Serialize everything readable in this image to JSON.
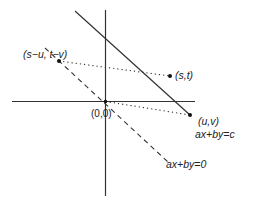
{
  "diagram": {
    "title": "",
    "labels": {
      "point_diff": "(s−u, t−v)",
      "point_st": "(s,t)",
      "point_uv": "(u,v)",
      "origin": "(0,0)",
      "line_c": "ax+by=c",
      "line_0": "ax+by=0"
    },
    "colors": {
      "stroke": "#333333",
      "background": "#ffffff"
    },
    "elements": [
      {
        "kind": "axis",
        "orientation": "horizontal"
      },
      {
        "kind": "axis",
        "orientation": "vertical"
      },
      {
        "kind": "line",
        "style": "solid",
        "equation": "ax+by=c"
      },
      {
        "kind": "line",
        "style": "dashed",
        "equation": "ax+by=0"
      },
      {
        "kind": "segment",
        "style": "dotted",
        "from": "(s−u, t−v)",
        "to": "(s,t)"
      },
      {
        "kind": "segment",
        "style": "dotted",
        "from": "(0,0)",
        "to": "(u,v)"
      },
      {
        "kind": "point",
        "label": "(s,t)"
      },
      {
        "kind": "point",
        "label": "(u,v)"
      },
      {
        "kind": "point",
        "label": "(s−u, t−v)"
      },
      {
        "kind": "point",
        "label": "(0,0)"
      }
    ]
  }
}
